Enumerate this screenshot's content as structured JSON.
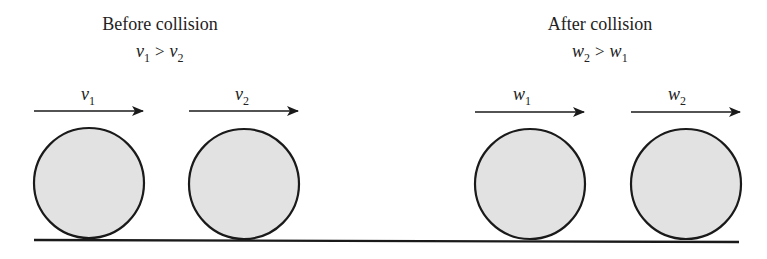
{
  "before": {
    "title": "Before collision",
    "condition": {
      "lhs": "v",
      "lhs_sub": "1",
      "op": ">",
      "rhs": "v",
      "rhs_sub": "2"
    },
    "balls": [
      {
        "label": "v",
        "sub": "1"
      },
      {
        "label": "v",
        "sub": "2"
      }
    ]
  },
  "after": {
    "title": "After collision",
    "condition": {
      "lhs": "w",
      "lhs_sub": "2",
      "op": ">",
      "rhs": "w",
      "rhs_sub": "1"
    },
    "balls": [
      {
        "label": "w",
        "sub": "1"
      },
      {
        "label": "w",
        "sub": "2"
      }
    ]
  },
  "colors": {
    "ball_fill": "#e2e2e2",
    "stroke": "#1a1a1a",
    "background": "#ffffff"
  }
}
